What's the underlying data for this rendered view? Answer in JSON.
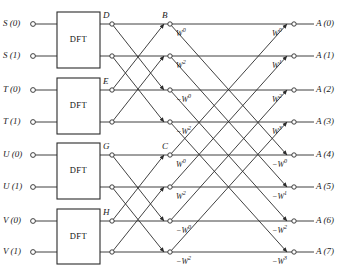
{
  "diagram": {
    "block_label": "DFT",
    "num_blocks": 4,
    "rows": 8,
    "colors": {
      "line": "#2b2b2b",
      "text": "#1a1a1a",
      "background": "#ffffff"
    },
    "inputs": [
      {
        "label": "S (0)",
        "row": 0
      },
      {
        "label": "S (1)",
        "row": 1
      },
      {
        "label": "T (0)",
        "row": 2
      },
      {
        "label": "T (1)",
        "row": 3
      },
      {
        "label": "U (0)",
        "row": 4
      },
      {
        "label": "U (1)",
        "row": 5
      },
      {
        "label": "V (0)",
        "row": 6
      },
      {
        "label": "V (1)",
        "row": 7
      }
    ],
    "outputs": [
      {
        "label": "A (0)",
        "row": 0
      },
      {
        "label": "A (1)",
        "row": 1
      },
      {
        "label": "A (2)",
        "row": 2
      },
      {
        "label": "A (3)",
        "row": 3
      },
      {
        "label": "A (4)",
        "row": 4
      },
      {
        "label": "A (5)",
        "row": 5
      },
      {
        "label": "A (6)",
        "row": 6
      },
      {
        "label": "A (7)",
        "row": 7
      }
    ],
    "node_labels": [
      {
        "name": "D",
        "row": 0,
        "stage": 1
      },
      {
        "name": "E",
        "row": 2,
        "stage": 1
      },
      {
        "name": "G",
        "row": 4,
        "stage": 1
      },
      {
        "name": "H",
        "row": 6,
        "stage": 1
      },
      {
        "name": "B",
        "row": 0,
        "stage": 2
      },
      {
        "name": "C",
        "row": 4,
        "stage": 2
      }
    ],
    "twiddle_stage2": [
      {
        "base": "W",
        "exp": "0",
        "sign": "",
        "row": 0
      },
      {
        "base": "W",
        "exp": "2",
        "sign": "",
        "row": 1
      },
      {
        "base": "W",
        "exp": "0",
        "sign": "−",
        "row": 2
      },
      {
        "base": "W",
        "exp": "2",
        "sign": "−",
        "row": 3
      },
      {
        "base": "W",
        "exp": "0",
        "sign": "",
        "row": 4
      },
      {
        "base": "W",
        "exp": "2",
        "sign": "",
        "row": 5
      },
      {
        "base": "W",
        "exp": "0",
        "sign": "−",
        "row": 6
      },
      {
        "base": "W",
        "exp": "2",
        "sign": "−",
        "row": 7
      }
    ],
    "twiddle_stage3": [
      {
        "base": "W",
        "exp": "0",
        "sign": "",
        "row": 0
      },
      {
        "base": "W",
        "exp": "1",
        "sign": "",
        "row": 1
      },
      {
        "base": "W",
        "exp": "2",
        "sign": "",
        "row": 2
      },
      {
        "base": "W",
        "exp": "3",
        "sign": "",
        "row": 3
      },
      {
        "base": "W",
        "exp": "0",
        "sign": "−",
        "row": 4
      },
      {
        "base": "W",
        "exp": "1",
        "sign": "−",
        "row": 5
      },
      {
        "base": "W",
        "exp": "2",
        "sign": "−",
        "row": 6
      },
      {
        "base": "W",
        "exp": "3",
        "sign": "−",
        "row": 7
      }
    ]
  }
}
